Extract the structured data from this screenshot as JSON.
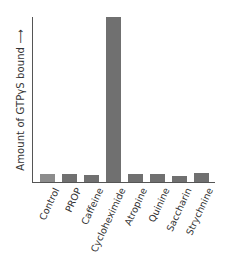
{
  "chart_data": {
    "type": "bar",
    "title": "",
    "xlabel": "",
    "ylabel": "Amount of GTPγS bound ⟶",
    "categories": [
      "Control",
      "PROP",
      "Caffeine",
      "Cycloheximide",
      "Atropine",
      "Quinine",
      "Saccharin",
      "Strychnine"
    ],
    "values": [
      8,
      8,
      7,
      165,
      8,
      7.5,
      6,
      8.5
    ],
    "value_units": "relative (no numeric axis ticks shown)",
    "ylim": [
      0,
      166
    ],
    "grid": false,
    "legend": null,
    "colors": {
      "control_bar": "#8c8c8c",
      "bars": "#707070",
      "axis": "#555555"
    }
  }
}
